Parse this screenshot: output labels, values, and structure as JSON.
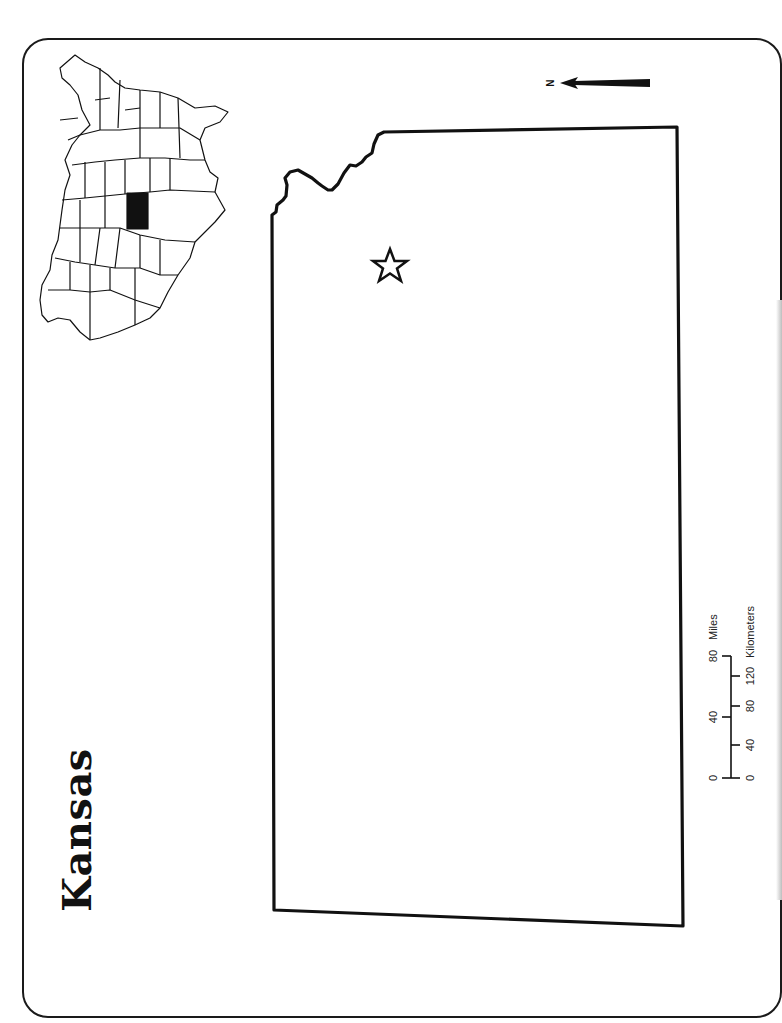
{
  "map": {
    "title": "Kansas",
    "inset": {
      "description": "Contiguous United States locator map (rotated)",
      "highlighted_state": "Kansas",
      "highlight_color": "#111111"
    },
    "capital_marker": {
      "symbol": "star-icon",
      "label": ""
    },
    "north_arrow": {
      "label": "N"
    },
    "scale_bar": {
      "miles_label": "Miles",
      "kilometers_label": "Kilometers",
      "miles_ticks": [
        "0",
        "40",
        "80"
      ],
      "km_ticks": [
        "0",
        "40",
        "80",
        "120"
      ]
    },
    "colors": {
      "outline": "#111111",
      "background": "#ffffff"
    }
  }
}
